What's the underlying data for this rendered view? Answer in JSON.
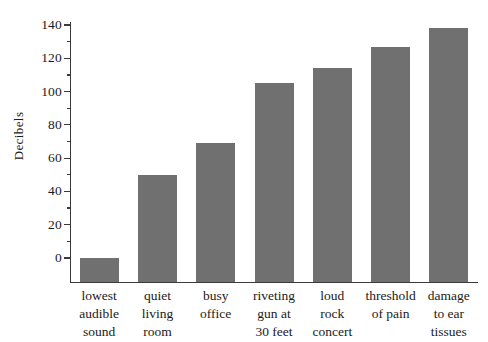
{
  "chart_data": {
    "type": "bar",
    "title": "",
    "xlabel": "",
    "ylabel": "Decibels",
    "ylim": [
      -10,
      145
    ],
    "grid": false,
    "legend": false,
    "orientation": "vertical",
    "bar_color": "#707070",
    "axis_color": "#3a3a3a",
    "background": "#ffffff",
    "categories": [
      "lowest\naudible\nsound",
      "quiet\nliving\nroom",
      "busy\noffice",
      "riveting\ngun at\n30 feet",
      "loud\nrock\nconcert",
      "threshold\nof pain",
      "damage\nto ear\ntissues"
    ],
    "values": [
      0,
      50,
      69,
      105,
      114,
      127,
      138
    ],
    "y_major_ticks": [
      0,
      20,
      40,
      60,
      80,
      100,
      120,
      140
    ],
    "y_major_tick_labels": [
      "0",
      "20",
      "40",
      "60",
      "80",
      "100",
      "120",
      "140"
    ],
    "y_minor_ticks": [
      10,
      30,
      50,
      70,
      90,
      110,
      130
    ]
  }
}
